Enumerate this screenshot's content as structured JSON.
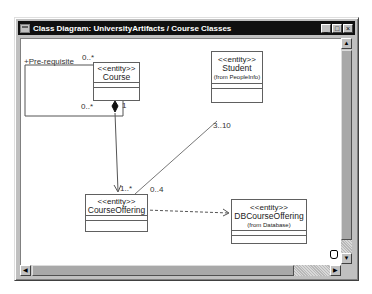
{
  "window": {
    "title": "Class Diagram: UniversityArtifacts / Course Classes",
    "icon": "diagram-window-icon",
    "buttons": {
      "minimize": "_",
      "maximize": "□",
      "close": "×"
    }
  },
  "diagram": {
    "classes": [
      {
        "id": "course",
        "stereotype": "<<entity>>",
        "name": "Course",
        "from": ""
      },
      {
        "id": "student",
        "stereotype": "<<entity>>",
        "name": "Student",
        "from": "(from PeopleInfo)"
      },
      {
        "id": "course_offering",
        "stereotype": "<<entity>>",
        "name": "CourseOffering",
        "from": ""
      },
      {
        "id": "db_course_offering",
        "stereotype": "<<entity>>",
        "name": "DBCourseOffering",
        "from": "(from Database)"
      }
    ],
    "relationships": [
      {
        "type": "self-association",
        "from": "course",
        "to": "course",
        "role": "+Pre-requisite",
        "mult_source": "0..*",
        "mult_target": "0..*"
      },
      {
        "type": "composition",
        "from": "course",
        "to": "course_offering",
        "mult_source": "1",
        "mult_target": "1..*"
      },
      {
        "type": "association",
        "from": "student",
        "to": "course_offering",
        "mult_source": "3..10",
        "mult_target": "0..4"
      },
      {
        "type": "dependency",
        "from": "course_offering",
        "to": "db_course_offering"
      }
    ],
    "labels": {
      "prereq_role": "+Pre-requisite",
      "self_mult_top": "0..*",
      "self_mult_bottom": "0..*",
      "comp_mult_course": "1",
      "comp_mult_offering": "1..*",
      "assoc_mult_student": "3..10",
      "assoc_mult_offering": "0..4"
    }
  },
  "scrollbars": {
    "up": "▲",
    "down": "▼",
    "left": "◀",
    "right": "▶"
  }
}
